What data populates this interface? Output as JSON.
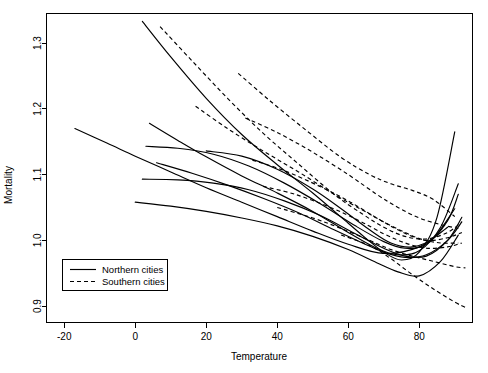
{
  "chart_data": {
    "type": "line",
    "title": "",
    "xlabel": "Temperature",
    "ylabel": "Mortality",
    "xlim": [
      -25,
      95
    ],
    "ylim": [
      0.875,
      1.345
    ],
    "xticks": [
      -20,
      0,
      20,
      40,
      60,
      80
    ],
    "xtick_labels": [
      "-20",
      "0",
      "20",
      "40",
      "60",
      "80"
    ],
    "yticks": [
      0.9,
      1.0,
      1.1,
      1.2,
      1.3
    ],
    "ytick_labels": [
      "0.9",
      "1.0",
      "1.1",
      "1.2",
      "1.3"
    ],
    "grid": false,
    "legend_position": "bottom-left",
    "legend": [
      {
        "label": "Northern cities",
        "style": "solid"
      },
      {
        "label": "Southern cities",
        "style": "dashed"
      }
    ],
    "series": [
      {
        "name": "north-1",
        "group": "Northern cities",
        "style": "solid",
        "x": [
          -17,
          -8,
          0,
          10,
          20,
          30,
          40,
          50,
          60,
          70,
          80,
          88
        ],
        "y": [
          1.17,
          1.148,
          1.128,
          1.104,
          1.08,
          1.058,
          1.036,
          1.014,
          0.994,
          0.98,
          0.99,
          1.02
        ]
      },
      {
        "name": "north-2",
        "group": "Northern cities",
        "style": "solid",
        "x": [
          2,
          10,
          20,
          30,
          40,
          50,
          60,
          65,
          70,
          75,
          80,
          85,
          90
        ],
        "y": [
          1.333,
          1.279,
          1.216,
          1.161,
          1.115,
          1.072,
          1.026,
          1.003,
          0.982,
          0.97,
          0.982,
          1.035,
          1.165
        ]
      },
      {
        "name": "north-3",
        "group": "Northern cities",
        "style": "solid",
        "x": [
          4,
          12,
          20,
          30,
          40,
          50,
          60,
          68,
          74,
          80,
          86,
          91
        ],
        "y": [
          1.178,
          1.152,
          1.127,
          1.098,
          1.072,
          1.044,
          1.012,
          0.988,
          0.978,
          0.984,
          1.02,
          1.086
        ]
      },
      {
        "name": "north-4",
        "group": "Northern cities",
        "style": "solid",
        "x": [
          3,
          12,
          22,
          32,
          42,
          52,
          62,
          70,
          76,
          82,
          88,
          91
        ],
        "y": [
          1.143,
          1.14,
          1.131,
          1.113,
          1.087,
          1.056,
          1.022,
          0.998,
          0.988,
          0.994,
          1.03,
          1.07
        ]
      },
      {
        "name": "north-5",
        "group": "Northern cities",
        "style": "solid",
        "x": [
          2,
          12,
          22,
          32,
          42,
          52,
          62,
          70,
          76,
          82,
          88,
          92
        ],
        "y": [
          1.093,
          1.092,
          1.087,
          1.077,
          1.06,
          1.038,
          1.01,
          0.988,
          0.976,
          0.976,
          1.0,
          1.035
        ]
      },
      {
        "name": "north-6",
        "group": "Northern cities",
        "style": "solid",
        "x": [
          0,
          10,
          20,
          30,
          40,
          50,
          60,
          68,
          74,
          80,
          86,
          91
        ],
        "y": [
          1.058,
          1.052,
          1.044,
          1.034,
          1.022,
          1.006,
          0.986,
          0.966,
          0.952,
          0.946,
          0.968,
          1.008
        ]
      },
      {
        "name": "north-7",
        "group": "Northern cities",
        "style": "solid",
        "x": [
          6,
          16,
          26,
          36,
          46,
          56,
          64,
          70,
          76,
          82,
          88,
          92
        ],
        "y": [
          1.118,
          1.102,
          1.084,
          1.064,
          1.042,
          1.016,
          0.996,
          0.982,
          0.974,
          0.978,
          1.0,
          1.028
        ]
      },
      {
        "name": "north-8",
        "group": "Northern cities",
        "style": "solid",
        "x": [
          20,
          30,
          40,
          50,
          58,
          66,
          72,
          78,
          84,
          90
        ],
        "y": [
          1.136,
          1.128,
          1.108,
          1.078,
          1.048,
          1.016,
          0.996,
          0.99,
          1.004,
          1.048
        ]
      },
      {
        "name": "south-1",
        "group": "Southern cities",
        "style": "dashed",
        "x": [
          7,
          16,
          26,
          36,
          46,
          56,
          64,
          70,
          76,
          82,
          88,
          92
        ],
        "y": [
          1.325,
          1.273,
          1.216,
          1.163,
          1.116,
          1.07,
          1.04,
          1.02,
          1.006,
          1.002,
          1.012,
          1.028
        ]
      },
      {
        "name": "south-2",
        "group": "Southern cities",
        "style": "dashed",
        "x": [
          17,
          26,
          36,
          46,
          56,
          64,
          70,
          76,
          82,
          88,
          92
        ],
        "y": [
          1.204,
          1.17,
          1.136,
          1.104,
          1.07,
          1.046,
          1.028,
          1.012,
          1.0,
          1.004,
          1.012
        ]
      },
      {
        "name": "south-3",
        "group": "Southern cities",
        "style": "dashed",
        "x": [
          29,
          38,
          48,
          58,
          66,
          72,
          78,
          84,
          90
        ],
        "y": [
          1.254,
          1.212,
          1.168,
          1.126,
          1.1,
          1.086,
          1.076,
          1.062,
          1.036
        ]
      },
      {
        "name": "south-4",
        "group": "Southern cities",
        "style": "dashed",
        "x": [
          31,
          40,
          50,
          60,
          68,
          74,
          80,
          86,
          91
        ],
        "y": [
          1.186,
          1.164,
          1.134,
          1.1,
          1.07,
          1.05,
          1.034,
          1.024,
          1.018
        ]
      },
      {
        "name": "south-5",
        "group": "Southern cities",
        "style": "dashed",
        "x": [
          33,
          42,
          52,
          60,
          68,
          74,
          80,
          86,
          91
        ],
        "y": [
          1.122,
          1.106,
          1.082,
          1.06,
          1.034,
          1.016,
          1.002,
          0.996,
          0.996
        ]
      },
      {
        "name": "south-6",
        "group": "Southern cities",
        "style": "dashed",
        "x": [
          36,
          45,
          55,
          63,
          70,
          76,
          82,
          88,
          92
        ],
        "y": [
          1.082,
          1.07,
          1.05,
          1.03,
          1.01,
          0.996,
          0.988,
          0.99,
          0.996
        ]
      },
      {
        "name": "south-7",
        "group": "Southern cities",
        "style": "dashed",
        "x": [
          40,
          50,
          58,
          66,
          72,
          78,
          84,
          90,
          93
        ],
        "y": [
          1.05,
          1.034,
          1.018,
          1.0,
          0.986,
          0.976,
          0.968,
          0.96,
          0.958
        ]
      },
      {
        "name": "south-8",
        "group": "Southern cities",
        "style": "dashed",
        "x": [
          58,
          66,
          72,
          78,
          84,
          90,
          93
        ],
        "y": [
          1.008,
          0.992,
          0.972,
          0.948,
          0.926,
          0.906,
          0.898
        ]
      }
    ]
  }
}
